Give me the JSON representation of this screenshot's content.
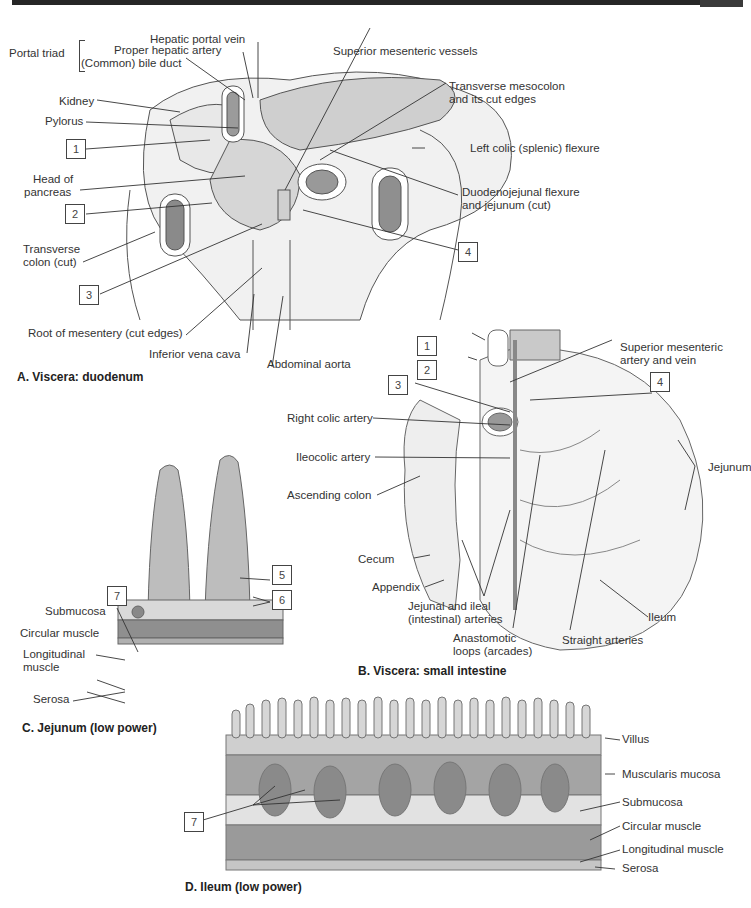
{
  "panels": {
    "a": {
      "caption": "A. Viscera: duodenum",
      "portal_triad": {
        "group_label": "Portal triad",
        "items": [
          "Hepatic portal vein",
          "Proper hepatic artery",
          "(Common) bile duct"
        ]
      },
      "labels": {
        "superior_mesenteric_vessels": "Superior mesenteric vessels",
        "kidney": "Kidney",
        "pylorus": "Pylorus",
        "transverse_mesocolon_1": "Transverse mesocolon",
        "transverse_mesocolon_2": "and its cut edges",
        "left_colic_flexure": "Left colic (splenic) flexure",
        "head_of_pancreas_1": "Head of",
        "head_of_pancreas_2": "pancreas",
        "duodenojejunal_1": "Duodenojejunal flexure",
        "duodenojejunal_2": "and jejunum (cut)",
        "transverse_colon_1": "Transverse",
        "transverse_colon_2": "colon (cut)",
        "root_of_mesentery": "Root of mesentery (cut edges)",
        "inferior_vena_cava": "Inferior vena cava",
        "abdominal_aorta": "Abdominal aorta"
      },
      "boxes": [
        "1",
        "2",
        "3",
        "4"
      ]
    },
    "b": {
      "caption": "B. Viscera: small intestine",
      "labels": {
        "sma_1": "Superior mesenteric",
        "sma_2": "artery and vein",
        "right_colic_artery": "Right colic artery",
        "ileocolic_artery": "Ileocolic artery",
        "ascending_colon": "Ascending colon",
        "jejunum": "Jejunum",
        "cecum": "Cecum",
        "appendix": "Appendix",
        "jejunal_ileal_1": "Jejunal and ileal",
        "jejunal_ileal_2": "(intestinal) arteries",
        "ileum": "Ileum",
        "anastomotic_1": "Anastomotic",
        "anastomotic_2": "loops (arcades)",
        "straight_arteries": "Straight arteries"
      },
      "boxes": [
        "1",
        "2",
        "3",
        "4"
      ]
    },
    "c": {
      "caption": "C. Jejunum (low power)",
      "labels": {
        "submucosa": "Submucosa",
        "circular_muscle": "Circular muscle",
        "longitudinal_1": "Longitudinal",
        "longitudinal_2": "muscle",
        "serosa": "Serosa"
      },
      "boxes": [
        "5",
        "6",
        "7"
      ]
    },
    "d": {
      "caption": "D. Ileum (low power)",
      "labels": {
        "villus": "Villus",
        "muscularis_mucosa": "Muscularis mucosa",
        "submucosa": "Submucosa",
        "circular_muscle": "Circular muscle",
        "longitudinal_muscle": "Longitudinal muscle",
        "serosa": "Serosa"
      },
      "boxes": [
        "7"
      ]
    }
  },
  "colors": {
    "ink": "#333333",
    "organ_fill": "#ececec",
    "pancreas_fill": "#c9c9c9",
    "lumen_fill": "#8a8a8a",
    "histology_fill": "#9a9a9a",
    "bar": "#262626"
  }
}
